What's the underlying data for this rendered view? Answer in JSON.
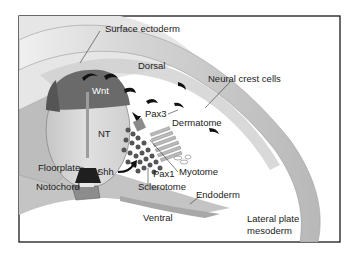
{
  "figure": {
    "frame_color": "#1a1a1a",
    "colors": {
      "background": "#ffffff",
      "ectoderm_band": "#c8c8c8",
      "ectoderm_light": "#e2e2e2",
      "neural_tube": "#d9d9d9",
      "wnt_region": "#6e6e6e",
      "floorplate": "#2a2a2a",
      "notochord": "#8a8a8a",
      "cells": "#111111",
      "sclerotome_cells": "#555555"
    },
    "labels": {
      "surface_ectoderm": "Surface ectoderm",
      "dorsal": "Dorsal",
      "neural_crest_cells": "Neural crest cells",
      "wnt": "Wnt",
      "pax3": "Pax3",
      "dermatome": "Dermatome",
      "nt": "NT",
      "floorplate": "Floorplate",
      "shh": "Shh",
      "notochord": "Notochord",
      "pax1": "Pax1",
      "myotome": "Myotome",
      "sclerotome": "Sclerotome",
      "endoderm": "Endoderm",
      "ventral": "Ventral",
      "lateral_plate_line1": "Lateral plate",
      "lateral_plate_line2": "mesoderm"
    }
  }
}
